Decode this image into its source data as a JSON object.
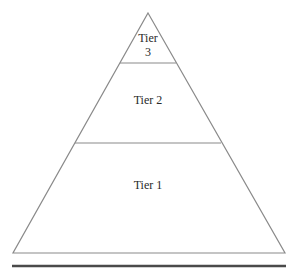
{
  "diagram": {
    "type": "pyramid",
    "tiers": [
      {
        "id": "tier-3",
        "line1": "Tier",
        "line2": "3",
        "position": "top"
      },
      {
        "id": "tier-2",
        "label": "Tier 2",
        "position": "middle"
      },
      {
        "id": "tier-1",
        "label": "Tier 1",
        "position": "bottom"
      }
    ],
    "colors": {
      "outline": "#8a8a8a",
      "baseline": "#4a4a4a",
      "text": "#2a2a2a",
      "background": "#ffffff"
    }
  }
}
